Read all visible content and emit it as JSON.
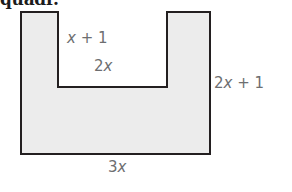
{
  "heading": {
    "text": "quadr.",
    "note": "top heading clipped by crop"
  },
  "figure": {
    "name": "u-shaped-polygon",
    "fill_color": "#ececec",
    "stroke_color": "#231f20",
    "stroke_width": 2,
    "background_color": "#ffffff",
    "label_color": "#6d6e70",
    "outline_points": "21,12 58,12 58,87 167,87 167,12 210,12 210,154 21,154",
    "labels": {
      "inner_left_height": {
        "coefficient": "",
        "variable": "x",
        "operator": " + ",
        "constant": "1",
        "full": "x + 1"
      },
      "notch_width": {
        "coefficient": "2",
        "variable": "x",
        "operator": "",
        "constant": "",
        "full": "2x"
      },
      "right_height": {
        "coefficient": "2",
        "variable": "x",
        "operator": " + ",
        "constant": "1",
        "full": "2x + 1"
      },
      "bottom_width": {
        "coefficient": "3",
        "variable": "x",
        "operator": "",
        "constant": "",
        "full": "3x"
      }
    }
  }
}
